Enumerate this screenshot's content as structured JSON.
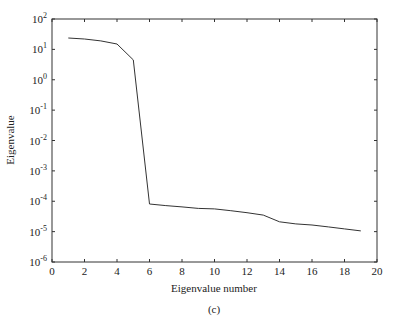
{
  "chart_data": {
    "type": "line",
    "title": "",
    "caption": "(c)",
    "xlabel": "Eigenvalue number",
    "ylabel": "Eigenvalue",
    "xlim": [
      0,
      20
    ],
    "ylim": [
      1e-06,
      100
    ],
    "yscale": "log",
    "grid": false,
    "legend": null,
    "x_ticks": [
      "0",
      "2",
      "4",
      "6",
      "8",
      "10",
      "12",
      "14",
      "16",
      "18",
      "20"
    ],
    "y_ticks": [
      "10^2",
      "10^1",
      "10^0",
      "10^-1",
      "10^-2",
      "10^-3",
      "10^-4",
      "10^-5",
      "10^-6"
    ],
    "x": [
      1,
      2,
      3,
      4,
      5,
      6,
      7,
      8,
      9,
      10,
      11,
      12,
      13,
      14,
      15,
      16,
      17,
      18,
      19
    ],
    "series": [
      {
        "name": "Eigenvalue",
        "values": [
          23.7,
          22,
          19,
          15,
          4.5,
          8.1e-05,
          7.2e-05,
          6.5e-05,
          5.8e-05,
          5.6e-05,
          4.9e-05,
          4.2e-05,
          3.5e-05,
          2.1e-05,
          1.8e-05,
          1.65e-05,
          1.43e-05,
          1.23e-05,
          1.06e-05
        ]
      }
    ]
  },
  "labels": {
    "xlabel": "Eigenvalue number",
    "ylabel": "Eigenvalue",
    "caption": "(c)"
  },
  "style": {
    "line_color": "#333333",
    "axis_color": "#333333"
  }
}
